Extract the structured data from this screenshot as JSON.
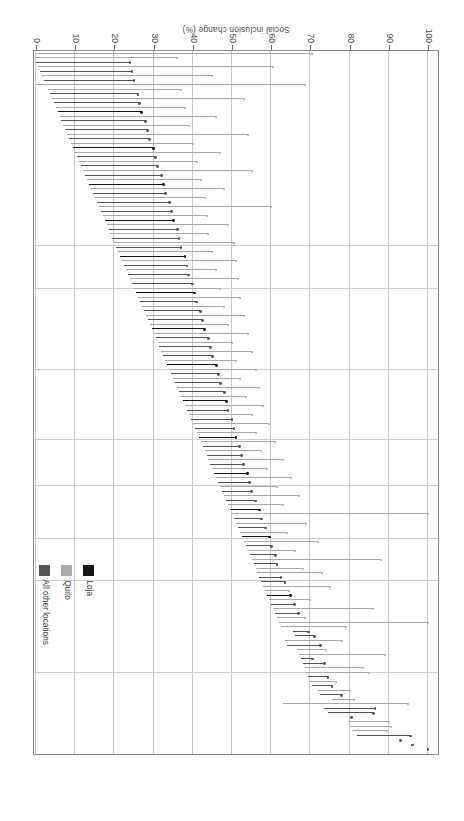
{
  "figure": {
    "background": "#ffffff",
    "orientation_note": "rotated-180"
  },
  "chart_data": {
    "type": "bar",
    "subtype": "horizontal-range-lollipop",
    "title": "",
    "subtitle": "",
    "xlabel": "Social inclusion change (%)",
    "ylabel": "",
    "xlim": [
      0,
      100
    ],
    "ylim": [
      0,
      155
    ],
    "x_ticks": [
      100,
      90,
      80,
      70,
      60,
      50,
      40,
      30,
      20,
      10,
      0
    ],
    "x_tick_labels": [
      "100",
      "90",
      "80",
      "70",
      "60",
      "50",
      "40",
      "30",
      "20",
      "10",
      "0"
    ],
    "x_axis_direction": "descending-left-to-right",
    "y_ticks": [],
    "y_tick_labels": [],
    "grid": {
      "vertical": true,
      "horizontal": false
    },
    "legend": {
      "position": "top-right",
      "entries": [
        {
          "name": "Loja",
          "color": "#151515"
        },
        {
          "name": "Quito",
          "color": "#aaaaaa"
        },
        {
          "name": "All other locations",
          "color": "#555555"
        }
      ]
    },
    "series_note": "Each row is one respondent: a segment spanning from a start value to an end value with a dot marker at the start.",
    "rows": [
      {
        "g": 2,
        "s": 100.0,
        "e": 100.0
      },
      {
        "g": 2,
        "s": 96.0,
        "e": 96.0
      },
      {
        "g": 2,
        "s": 93.0,
        "e": 93.0
      },
      {
        "g": 2,
        "s": 95.5,
        "e": 82.0
      },
      {
        "g": 1,
        "s": 89.5,
        "e": 80.5
      },
      {
        "g": 1,
        "s": 90.5,
        "e": 80.0
      },
      {
        "g": 1,
        "s": 90.0,
        "e": 79.5
      },
      {
        "g": 2,
        "s": 80.5,
        "e": 80.5
      },
      {
        "g": 2,
        "s": 86.0,
        "e": 74.5
      },
      {
        "g": 2,
        "s": 86.5,
        "e": 73.5
      },
      {
        "g": 1,
        "s": 95.0,
        "e": 63.0
      },
      {
        "g": 1,
        "s": 81.0,
        "e": 75.5
      },
      {
        "g": 2,
        "s": 78.0,
        "e": 72.5
      },
      {
        "g": 1,
        "s": 80.0,
        "e": 72.0
      },
      {
        "g": 2,
        "s": 75.5,
        "e": 70.5
      },
      {
        "g": 1,
        "s": 76.5,
        "e": 70.0
      },
      {
        "g": 2,
        "s": 74.5,
        "e": 69.5
      },
      {
        "g": 1,
        "s": 85.0,
        "e": 69.0
      },
      {
        "g": 1,
        "s": 83.5,
        "e": 68.5
      },
      {
        "g": 2,
        "s": 73.5,
        "e": 68.0
      },
      {
        "g": 2,
        "s": 70.5,
        "e": 67.5
      },
      {
        "g": 1,
        "s": 89.0,
        "e": 67.0
      },
      {
        "g": 1,
        "s": 74.0,
        "e": 66.5
      },
      {
        "g": 2,
        "s": 72.5,
        "e": 64.0
      },
      {
        "g": 1,
        "s": 78.0,
        "e": 63.5
      },
      {
        "g": 2,
        "s": 71.0,
        "e": 66.0
      },
      {
        "g": 2,
        "s": 69.5,
        "e": 65.5
      },
      {
        "g": 1,
        "s": 79.0,
        "e": 62.5
      },
      {
        "g": 1,
        "s": 100.0,
        "e": 62.0
      },
      {
        "g": 1,
        "s": 68.5,
        "e": 61.5
      },
      {
        "g": 2,
        "s": 67.0,
        "e": 61.0
      },
      {
        "g": 1,
        "s": 86.0,
        "e": 60.5
      },
      {
        "g": 2,
        "s": 66.0,
        "e": 60.0
      },
      {
        "g": 1,
        "s": 70.0,
        "e": 59.5
      },
      {
        "g": 0,
        "s": 65.0,
        "e": 59.0
      },
      {
        "g": 1,
        "s": 64.5,
        "e": 58.5
      },
      {
        "g": 1,
        "s": 75.0,
        "e": 58.0
      },
      {
        "g": 2,
        "s": 63.5,
        "e": 57.5
      },
      {
        "g": 2,
        "s": 62.5,
        "e": 57.0
      },
      {
        "g": 1,
        "s": 73.0,
        "e": 56.5
      },
      {
        "g": 1,
        "s": 68.0,
        "e": 56.0
      },
      {
        "g": 2,
        "s": 61.5,
        "e": 55.5
      },
      {
        "g": 1,
        "s": 88.0,
        "e": 55.0
      },
      {
        "g": 2,
        "s": 61.0,
        "e": 54.5
      },
      {
        "g": 1,
        "s": 66.0,
        "e": 54.0
      },
      {
        "g": 2,
        "s": 60.0,
        "e": 53.5
      },
      {
        "g": 1,
        "s": 72.0,
        "e": 53.0
      },
      {
        "g": 0,
        "s": 59.5,
        "e": 52.5
      },
      {
        "g": 1,
        "s": 64.0,
        "e": 52.0
      },
      {
        "g": 2,
        "s": 58.5,
        "e": 51.5
      },
      {
        "g": 1,
        "s": 69.0,
        "e": 51.0
      },
      {
        "g": 2,
        "s": 57.5,
        "e": 50.5
      },
      {
        "g": 1,
        "s": 100.0,
        "e": 50.0
      },
      {
        "g": 0,
        "s": 57.0,
        "e": 49.5
      },
      {
        "g": 1,
        "s": 63.0,
        "e": 49.0
      },
      {
        "g": 2,
        "s": 56.0,
        "e": 48.5
      },
      {
        "g": 1,
        "s": 67.0,
        "e": 48.0
      },
      {
        "g": 2,
        "s": 55.0,
        "e": 47.5
      },
      {
        "g": 1,
        "s": 61.5,
        "e": 47.0
      },
      {
        "g": 2,
        "s": 54.5,
        "e": 46.5
      },
      {
        "g": 1,
        "s": 65.0,
        "e": 46.0
      },
      {
        "g": 0,
        "s": 54.0,
        "e": 45.5
      },
      {
        "g": 1,
        "s": 59.0,
        "e": 45.0
      },
      {
        "g": 2,
        "s": 53.0,
        "e": 44.5
      },
      {
        "g": 1,
        "s": 63.0,
        "e": 44.0
      },
      {
        "g": 2,
        "s": 52.5,
        "e": 43.5
      },
      {
        "g": 1,
        "s": 57.5,
        "e": 43.0
      },
      {
        "g": 2,
        "s": 52.0,
        "e": 42.5
      },
      {
        "g": 1,
        "s": 61.0,
        "e": 42.0
      },
      {
        "g": 0,
        "s": 51.0,
        "e": 41.5
      },
      {
        "g": 1,
        "s": 56.0,
        "e": 41.0
      },
      {
        "g": 2,
        "s": 50.5,
        "e": 40.5
      },
      {
        "g": 1,
        "s": 59.5,
        "e": 40.0
      },
      {
        "g": 2,
        "s": 50.0,
        "e": 39.5
      },
      {
        "g": 1,
        "s": 55.0,
        "e": 39.0
      },
      {
        "g": 2,
        "s": 49.0,
        "e": 38.5
      },
      {
        "g": 1,
        "s": 58.0,
        "e": 38.0
      },
      {
        "g": 0,
        "s": 48.5,
        "e": 37.5
      },
      {
        "g": 1,
        "s": 53.5,
        "e": 37.0
      },
      {
        "g": 2,
        "s": 48.0,
        "e": 36.5
      },
      {
        "g": 1,
        "s": 57.0,
        "e": 36.0
      },
      {
        "g": 2,
        "s": 47.0,
        "e": 35.5
      },
      {
        "g": 1,
        "s": 52.0,
        "e": 35.0
      },
      {
        "g": 2,
        "s": 46.5,
        "e": 34.5
      },
      {
        "g": 1,
        "s": 56.0,
        "e": 34.0
      },
      {
        "g": 0,
        "s": 46.0,
        "e": 33.5
      },
      {
        "g": 1,
        "s": 51.0,
        "e": 33.0
      },
      {
        "g": 2,
        "s": 45.0,
        "e": 32.5
      },
      {
        "g": 1,
        "s": 55.0,
        "e": 32.0
      },
      {
        "g": 2,
        "s": 44.5,
        "e": 31.5
      },
      {
        "g": 1,
        "s": 50.0,
        "e": 31.0
      },
      {
        "g": 2,
        "s": 44.0,
        "e": 30.5
      },
      {
        "g": 1,
        "s": 54.0,
        "e": 30.0
      },
      {
        "g": 0,
        "s": 43.0,
        "e": 29.5
      },
      {
        "g": 1,
        "s": 49.0,
        "e": 29.0
      },
      {
        "g": 2,
        "s": 42.5,
        "e": 28.5
      },
      {
        "g": 1,
        "s": 53.0,
        "e": 28.0
      },
      {
        "g": 2,
        "s": 42.0,
        "e": 27.5
      },
      {
        "g": 1,
        "s": 48.0,
        "e": 27.0
      },
      {
        "g": 2,
        "s": 41.0,
        "e": 26.5
      },
      {
        "g": 1,
        "s": 52.0,
        "e": 26.0
      },
      {
        "g": 0,
        "s": 40.5,
        "e": 25.5
      },
      {
        "g": 1,
        "s": 47.0,
        "e": 25.0
      },
      {
        "g": 2,
        "s": 40.0,
        "e": 24.5
      },
      {
        "g": 1,
        "s": 51.5,
        "e": 24.0
      },
      {
        "g": 2,
        "s": 39.0,
        "e": 23.5
      },
      {
        "g": 1,
        "s": 46.0,
        "e": 23.0
      },
      {
        "g": 2,
        "s": 38.5,
        "e": 22.5
      },
      {
        "g": 1,
        "s": 51.0,
        "e": 22.0
      },
      {
        "g": 0,
        "s": 38.0,
        "e": 21.5
      },
      {
        "g": 1,
        "s": 45.0,
        "e": 21.0
      },
      {
        "g": 2,
        "s": 37.0,
        "e": 20.5
      },
      {
        "g": 1,
        "s": 50.5,
        "e": 20.0
      },
      {
        "g": 2,
        "s": 36.5,
        "e": 19.5
      },
      {
        "g": 1,
        "s": 44.0,
        "e": 19.0
      },
      {
        "g": 2,
        "s": 36.0,
        "e": 18.5
      },
      {
        "g": 1,
        "s": 49.0,
        "e": 18.0
      },
      {
        "g": 0,
        "s": 35.0,
        "e": 17.5
      },
      {
        "g": 1,
        "s": 43.5,
        "e": 17.0
      },
      {
        "g": 2,
        "s": 34.5,
        "e": 16.5
      },
      {
        "g": 1,
        "s": 60.0,
        "e": 16.0
      },
      {
        "g": 2,
        "s": 34.0,
        "e": 15.5
      },
      {
        "g": 1,
        "s": 43.0,
        "e": 15.0
      },
      {
        "g": 2,
        "s": 33.0,
        "e": 14.5
      },
      {
        "g": 1,
        "s": 48.0,
        "e": 14.0
      },
      {
        "g": 0,
        "s": 32.5,
        "e": 13.5
      },
      {
        "g": 1,
        "s": 42.0,
        "e": 13.0
      },
      {
        "g": 2,
        "s": 32.0,
        "e": 12.5
      },
      {
        "g": 1,
        "s": 55.0,
        "e": 12.0
      },
      {
        "g": 2,
        "s": 31.0,
        "e": 11.5
      },
      {
        "g": 1,
        "s": 41.0,
        "e": 11.0
      },
      {
        "g": 2,
        "s": 30.5,
        "e": 10.5
      },
      {
        "g": 1,
        "s": 47.0,
        "e": 10.0
      },
      {
        "g": 0,
        "s": 30.0,
        "e": 9.5
      },
      {
        "g": 1,
        "s": 40.0,
        "e": 9.0
      },
      {
        "g": 2,
        "s": 29.0,
        "e": 8.5
      },
      {
        "g": 1,
        "s": 54.0,
        "e": 8.0
      },
      {
        "g": 2,
        "s": 28.5,
        "e": 7.5
      },
      {
        "g": 1,
        "s": 39.0,
        "e": 7.0
      },
      {
        "g": 2,
        "s": 28.0,
        "e": 6.5
      },
      {
        "g": 1,
        "s": 46.0,
        "e": 6.0
      },
      {
        "g": 0,
        "s": 27.0,
        "e": 5.5
      },
      {
        "g": 1,
        "s": 38.0,
        "e": 5.0
      },
      {
        "g": 2,
        "s": 26.5,
        "e": 4.5
      },
      {
        "g": 1,
        "s": 53.0,
        "e": 4.0
      },
      {
        "g": 2,
        "s": 26.0,
        "e": 3.5
      },
      {
        "g": 1,
        "s": 37.0,
        "e": 3.0
      },
      {
        "g": 1,
        "s": 68.5,
        "e": 0.0
      },
      {
        "g": 2,
        "s": 25.0,
        "e": 2.0
      },
      {
        "g": 1,
        "s": 45.0,
        "e": 1.5
      },
      {
        "g": 2,
        "s": 24.5,
        "e": 1.0
      },
      {
        "g": 1,
        "s": 60.5,
        "e": 0.5
      },
      {
        "g": 2,
        "s": 24.0,
        "e": 0.0
      },
      {
        "g": 1,
        "s": 36.0,
        "e": 0.0
      },
      {
        "g": 1,
        "s": 70.5,
        "e": 0.0
      }
    ]
  }
}
